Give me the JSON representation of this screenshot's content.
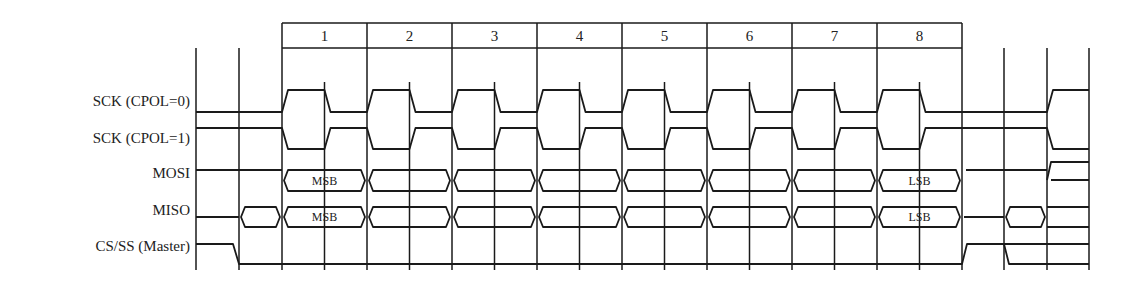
{
  "diagram": {
    "signals": [
      {
        "label": "SCK (CPOL=0)",
        "y": 104
      },
      {
        "label": "SCK (CPOL=1)",
        "y": 141
      },
      {
        "label": "MOSI",
        "y": 181
      },
      {
        "label": "MISO",
        "y": 217
      },
      {
        "label": "CS/SS (Master)",
        "y": 254
      }
    ],
    "bit_numbers": [
      "1",
      "2",
      "3",
      "4",
      "5",
      "6",
      "7",
      "8"
    ],
    "mosi_labels": {
      "first": "MSB",
      "last": "LSB"
    },
    "miso_labels": {
      "first": "MSB",
      "last": "LSB"
    },
    "stroke_color": "#1a1a1a"
  }
}
